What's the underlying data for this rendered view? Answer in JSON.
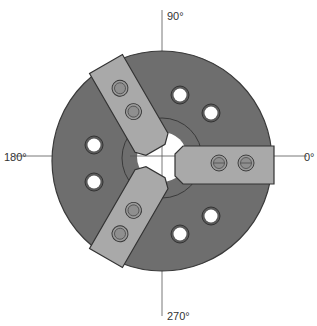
{
  "diagram": {
    "axis_labels": {
      "top": "90°",
      "left": "180°",
      "right": "0°",
      "bottom": "270°"
    },
    "jaws": [
      {
        "name": "jaw-0",
        "angle_deg": 0
      },
      {
        "name": "jaw-120",
        "angle_deg": 120
      },
      {
        "name": "jaw-240",
        "angle_deg": 240
      }
    ],
    "colors": {
      "body": "#6e6e6e",
      "jaw": "#a9a9a9",
      "outline": "#3a3a3a",
      "hole": "#ffffff",
      "axis": "#555555"
    }
  }
}
